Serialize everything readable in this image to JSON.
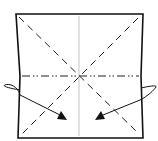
{
  "diagram": {
    "type": "origami-fold-instruction",
    "colors": {
      "background": "#ffffff",
      "ink": "#111111",
      "crease": "#9a9a9a"
    },
    "paper": {
      "corners": [
        [
          16,
          14
        ],
        [
          143,
          14
        ],
        [
          143,
          138
        ],
        [
          17,
          138
        ]
      ]
    },
    "lines": {
      "center_vertical": {
        "style": "thin solid crease",
        "x": 79
      },
      "horizontal_fold": {
        "style": "mountain (dash-dot-dot)",
        "y": 76
      },
      "diagonals": {
        "style": "valley (dashed)",
        "count": 2
      }
    },
    "arrows": [
      {
        "name": "left-fold-arrow",
        "from": "left edge",
        "to": [
          66,
          118
        ],
        "direction": "inward-right"
      },
      {
        "name": "right-fold-arrow",
        "from": "right edge",
        "to": [
          96,
          118
        ],
        "direction": "inward-left"
      }
    ]
  }
}
